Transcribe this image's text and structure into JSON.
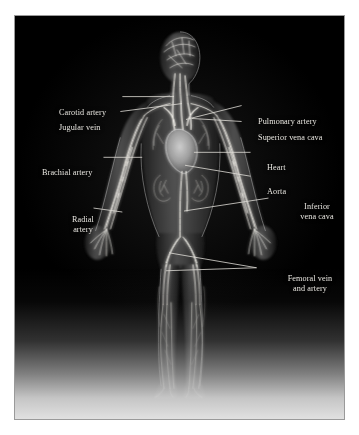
{
  "figure": {
    "background_color": "#000000",
    "label_color": "#e8e6e0",
    "leader_line_color": "#e0ded8",
    "border_color": "#9a9a9a"
  },
  "labels": {
    "carotid_artery": "Carotid artery",
    "jugular_vein": "Jugular vein",
    "brachial_artery": "Brachial artery",
    "radial_artery_line1": "Radial",
    "radial_artery_line2": "artery",
    "pulmonary_artery": "Pulmonary artery",
    "superior_vena_cava": "Superior vena cava",
    "heart": "Heart",
    "aorta": "Aorta",
    "inferior_vena_cava_line1": "Inferior",
    "inferior_vena_cava_line2": "vena cava",
    "femoral_line1": "Femoral vein",
    "femoral_line2": "and artery"
  }
}
